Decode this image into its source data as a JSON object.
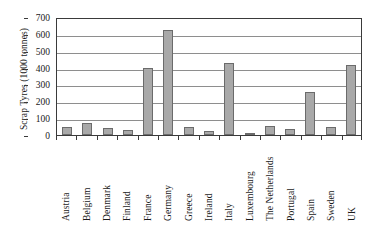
{
  "chart_data": {
    "type": "bar",
    "title": "",
    "xlabel": "",
    "ylabel": "Scrap Tyres (1000 tonnes)",
    "ylim": [
      0,
      700
    ],
    "yticks": [
      0,
      100,
      200,
      300,
      400,
      500,
      600,
      700
    ],
    "grid": true,
    "legend": false,
    "bar_color": "#a9a9a9",
    "bar_edge_color": "#6b6b6b",
    "categories": [
      "Austria",
      "Belgium",
      "Denmark",
      "Finland",
      "France",
      "Germany",
      "Greece",
      "Ireland",
      "Italy",
      "Luxembourg",
      "The Netherlands",
      "Portugal",
      "Spain",
      "Sweden",
      "UK"
    ],
    "values": [
      50,
      72,
      40,
      28,
      398,
      625,
      50,
      22,
      427,
      4,
      53,
      38,
      258,
      45,
      418
    ]
  }
}
